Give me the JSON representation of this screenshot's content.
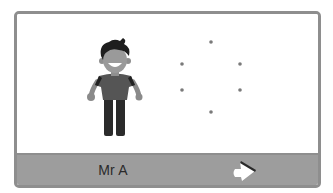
{
  "card": {
    "character": {
      "name": "Mr A",
      "icon": "boy-character-icon"
    },
    "dots": {
      "count": 6,
      "icon": "dot-pattern-icon",
      "positions": [
        [
          194,
          28
        ],
        [
          165,
          50
        ],
        [
          223,
          50
        ],
        [
          165,
          76
        ],
        [
          223,
          76
        ],
        [
          194,
          98
        ]
      ],
      "color": "#7a7a7a"
    },
    "next_button": {
      "icon": "arrow-right-icon"
    }
  },
  "colors": {
    "frame": "#8e8e8e",
    "bar": "#9d9d9d",
    "text": "#2a2a2a"
  }
}
